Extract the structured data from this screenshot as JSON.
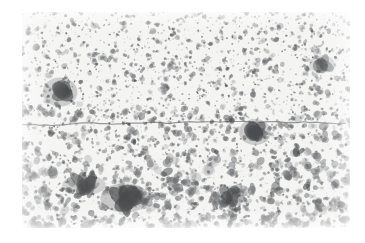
{
  "figure": {
    "kind": "scanned-grayscale-micrograph",
    "title": "",
    "caption": "",
    "plate": {
      "left_px": 22,
      "top_px": 12,
      "width_px": 328,
      "height_px": 216
    },
    "page_background": "#ffffff",
    "plate_background": "#f4f4f3",
    "ink_color": "#6f7173",
    "deep_ink_color": "#4a4c4e",
    "texture": {
      "description": "randomly distributed dark speckle grains and irregular blobs on a pale matrix, typical of a halftone-printed photomicrograph",
      "grain_count": 2400,
      "grain_min_radius_px": 0.8,
      "grain_max_radius_px": 4.2,
      "bands": [
        {
          "name": "upper-band",
          "y_start_px": 0,
          "y_end_px": 95,
          "grain_scale": 0.82,
          "density": 1.0,
          "note": "finer, more uniformly dispersed speckles"
        },
        {
          "name": "middle-band",
          "y_start_px": 95,
          "y_end_px": 150,
          "grain_scale": 1.05,
          "density": 1.08,
          "note": "transitional, grains begin to coalesce"
        },
        {
          "name": "lower-band",
          "y_start_px": 150,
          "y_end_px": 216,
          "grain_scale": 1.35,
          "density": 1.12,
          "note": "coarser, clustered and interconnected blobs"
        }
      ]
    },
    "features": [
      {
        "name": "horizontal-fracture-line",
        "type": "line",
        "x_start_px": 0,
        "x_end_px": 328,
        "y_px": 113,
        "thickness_px": 1.2,
        "wobble_px": 3.5,
        "opacity": 0.55,
        "note": "thin dark crack traversing the full field at roughly mid-height"
      },
      {
        "name": "dark-inclusion-upper-left",
        "type": "blob",
        "cx_px": 38,
        "cy_px": 80,
        "rx_px": 12,
        "ry_px": 10,
        "opacity": 0.62
      },
      {
        "name": "dark-inclusion-lower-left",
        "type": "blob",
        "cx_px": 103,
        "cy_px": 186,
        "rx_px": 17,
        "ry_px": 10,
        "opacity": 0.66
      },
      {
        "name": "dark-node-center-right",
        "type": "blob",
        "cx_px": 233,
        "cy_px": 120,
        "rx_px": 11,
        "ry_px": 9,
        "opacity": 0.6
      },
      {
        "name": "dark-streak-lower-left",
        "type": "blob",
        "cx_px": 62,
        "cy_px": 173,
        "rx_px": 15,
        "ry_px": 7,
        "opacity": 0.52
      },
      {
        "name": "dark-cluster-lower-right",
        "type": "blob",
        "cx_px": 208,
        "cy_px": 184,
        "rx_px": 10,
        "ry_px": 7,
        "opacity": 0.48
      },
      {
        "name": "dark-cluster-upper-right",
        "type": "blob",
        "cx_px": 300,
        "cy_px": 52,
        "rx_px": 9,
        "ry_px": 6,
        "opacity": 0.42
      }
    ],
    "random_seed": 20240517
  }
}
